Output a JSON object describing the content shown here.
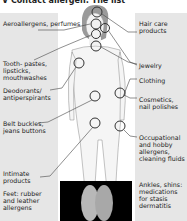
{
  "title": "V Contact allergen: The list",
  "left_labels": [
    "Aeroallergens, perfumes",
    "Tooth- pastes, lipsticks, mouthwashes",
    "Deodorants/ antiperspirants",
    "Belt buckles, jeans buttons",
    "Intimate products",
    "Feet: rubber and leather allergens"
  ],
  "right_labels": [
    "Hair care products",
    "Jewelry",
    "Clothing",
    "Cosmetics, nail polishes",
    "Occupational and hobby allergens, cleaning fluids",
    "Ankles, shins: medications for stasis dermatitis"
  ],
  "colors": {
    "panel": "#e6e6e6",
    "hair": "#9a9a9a",
    "body": "#f7f7f7",
    "circle": "#333333"
  }
}
